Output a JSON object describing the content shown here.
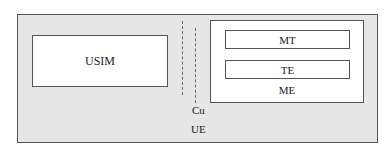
{
  "diagram": {
    "outer": {
      "label": "UE"
    },
    "usim": {
      "label": "USIM"
    },
    "interface": {
      "label": "Cu"
    },
    "me": {
      "label": "ME",
      "components": [
        {
          "label": "MT"
        },
        {
          "label": "TE"
        }
      ]
    }
  },
  "colors": {
    "outer_fill": "#e6e6e6",
    "box_fill": "#ffffff",
    "stroke": "#555555"
  }
}
